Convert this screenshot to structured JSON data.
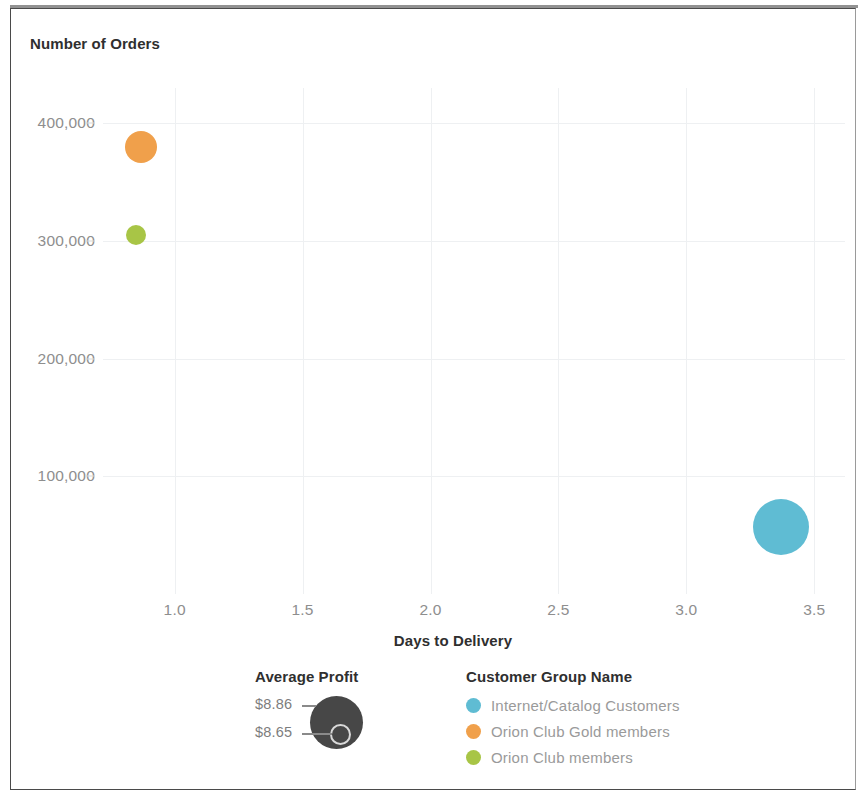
{
  "chart_data": {
    "type": "scatter",
    "title": "",
    "xlabel": "Days to Delivery",
    "ylabel": "Number of Orders",
    "xlim": [
      0.72,
      3.62
    ],
    "ylim": [
      0,
      430000
    ],
    "xticks": [
      "1.0",
      "1.5",
      "2.0",
      "2.5",
      "3.0",
      "3.5"
    ],
    "xtick_values": [
      1.0,
      1.5,
      2.0,
      2.5,
      3.0,
      3.5
    ],
    "yticks": [
      "400,000",
      "300,000",
      "200,000",
      "100,000"
    ],
    "ytick_values": [
      400000,
      300000,
      200000,
      100000
    ],
    "grid": true,
    "legend_position": "bottom",
    "size_field": "Average Profit",
    "color_field": "Customer Group Name",
    "points": [
      {
        "label": "Orion Club Gold members",
        "x": 0.87,
        "y": 380000,
        "size": 8.86,
        "color": "#F0A04B",
        "radius_px": 16
      },
      {
        "label": "Orion Club members",
        "x": 0.85,
        "y": 305000,
        "size": 8.65,
        "color": "#A8C546",
        "radius_px": 10
      },
      {
        "label": "Internet/Catalog Customers",
        "x": 3.37,
        "y": 57000,
        "size": 8.86,
        "color": "#5FBCD3",
        "radius_px": 28
      }
    ],
    "series": [
      {
        "name": "Internet/Catalog Customers",
        "color": "#5FBCD3"
      },
      {
        "name": "Orion Club Gold members",
        "color": "#F0A04B"
      },
      {
        "name": "Orion Club members",
        "color": "#A8C546"
      }
    ]
  },
  "axes": {
    "y_title": "Number of Orders",
    "x_title": "Days to Delivery"
  },
  "legend_size": {
    "title": "Average Profit",
    "max_label": "$8.86",
    "min_label": "$8.65"
  },
  "legend_color": {
    "title": "Customer Group Name",
    "items": [
      {
        "label": "Internet/Catalog Customers",
        "color": "#5FBCD3"
      },
      {
        "label": "Orion Club Gold members",
        "color": "#F0A04B"
      },
      {
        "label": "Orion Club members",
        "color": "#A8C546"
      }
    ]
  }
}
